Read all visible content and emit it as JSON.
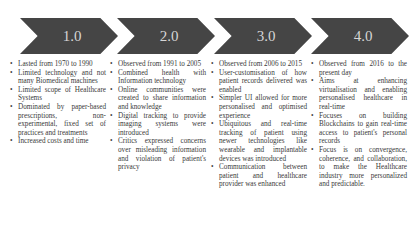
{
  "phases": [
    {
      "label": "1.0",
      "points": [
        "Lasted from 1970 to 1990",
        "Limited technology and not many Biomedical machines",
        "Limited scope of Healthcare Systems",
        "Dominated by paper-based prescriptions, non-experimental, fixed set of practices and treatments",
        "Increased costs and time"
      ]
    },
    {
      "label": "2.0",
      "points": [
        "Observed from 1991 to 2005",
        "Combined health with Information technology",
        "Online communities were created to share information and knowledge",
        "Digital tracking to provide imaging systems were introduced",
        "Critics expressed concerns over misleading information and violation of patient's privacy"
      ]
    },
    {
      "label": "3.0",
      "points": [
        "Observed from 2006 to 2015",
        "User-customisation of how patient records delivered was enabled",
        "Simpler UI allowed for more personalised and optimised experience",
        "Ubiquitous and real-time tracking of patient using newer technologies like wearable and implantable devices was introduced",
        "Communication between patient and healthcare provider was enhanced"
      ]
    },
    {
      "label": "4.0",
      "points": [
        "Observed from 2016 to the present day",
        "Aims at enhancing virtualisation and enabling personalised healthcare in real-time",
        "Focuses on building Blockchains to gain real-time access to patient's personal records",
        "Focus is on convergence, coherence, and collaboration, to make the Healthcare industry more personalized and predictable."
      ]
    }
  ],
  "colors": {
    "chevron": "#454545",
    "chevron_text": "#d6d6d6",
    "body_text": "#3a3a3a"
  }
}
